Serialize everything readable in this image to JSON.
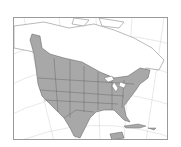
{
  "map": {
    "type": "range-map",
    "region": "North America",
    "projection": "conic",
    "colors": {
      "background": "#ffffff",
      "range_fill": "#a8a8a8",
      "land_outline": "#8c8c8c",
      "borders": "#5a5a5a",
      "graticule": "#d8d8d8",
      "water": "#ffffff",
      "frame": "#9a9a9a"
    },
    "shaded_area": "Contiguous United States, southern Canada, Mexico",
    "unshaded_areas": [
      "Northern Canada",
      "Alaska",
      "Greenland",
      "Caribbean",
      "Great Lakes"
    ]
  }
}
